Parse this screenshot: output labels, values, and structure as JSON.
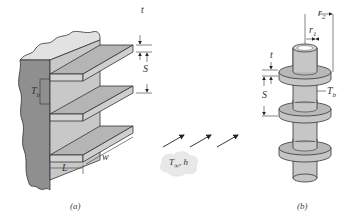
{
  "figure_a": {
    "caption": "(a)",
    "labels": {
      "t": "t",
      "S": "S",
      "Tb": "T",
      "Tb_sub": "b",
      "w": "w",
      "L": "L"
    }
  },
  "figure_b": {
    "caption": "(b)",
    "labels": {
      "r2": "r",
      "r2_sub": "2",
      "r1": "r",
      "r1_sub": "1",
      "t": "t",
      "S": "S",
      "Tb": "T",
      "Tb_sub": "b"
    }
  },
  "flow": {
    "label_T": "T",
    "label_T_sub": "∞",
    "label_h": ", h",
    "arrow_count": 3
  },
  "colors": {
    "wall": "#8f8f8f",
    "fin_top": "#b5b5b5",
    "fin_side": "#d4d4d4",
    "wall_top": "#e2e2e2",
    "outline": "#333333",
    "cloud": "#e8e8e8"
  }
}
